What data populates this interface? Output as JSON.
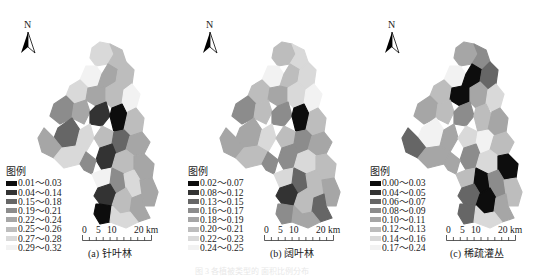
{
  "panels": [
    {
      "id": "a",
      "north_label": "N",
      "legend_title": "图例",
      "legend": [
        {
          "label": "0.01～0.03",
          "color": "#0d0d0d"
        },
        {
          "label": "0.04～0.14",
          "color": "#333333"
        },
        {
          "label": "0.15～0.18",
          "color": "#666666"
        },
        {
          "label": "0.19～0.21",
          "color": "#8c8c8c"
        },
        {
          "label": "0.22～0.24",
          "color": "#a6a6a6"
        },
        {
          "label": "0.25～0.26",
          "color": "#bdbdbd"
        },
        {
          "label": "0.27～0.28",
          "color": "#d9d9d9"
        },
        {
          "label": "0.29～0.32",
          "color": "#f2f2f2"
        }
      ],
      "scale_labels": [
        "0",
        "5",
        "10",
        "20 km"
      ],
      "caption": "(a) 针叶林",
      "region_classes": [
        6,
        5,
        7,
        4,
        5,
        6,
        0,
        4,
        5,
        7,
        3,
        4,
        2,
        1,
        0,
        5,
        4,
        6,
        5,
        2,
        4,
        6,
        1,
        3,
        5,
        4,
        7,
        3,
        1,
        6,
        4,
        5,
        0,
        4,
        6
      ]
    },
    {
      "id": "b",
      "north_label": "N",
      "legend_title": "图例",
      "legend": [
        {
          "label": "0.02～0.07",
          "color": "#0d0d0d"
        },
        {
          "label": "0.08～0.12",
          "color": "#333333"
        },
        {
          "label": "0.13～0.15",
          "color": "#666666"
        },
        {
          "label": "0.16～0.17",
          "color": "#8c8c8c"
        },
        {
          "label": "0.18～0.19",
          "color": "#a6a6a6"
        },
        {
          "label": "0.20～0.21",
          "color": "#bdbdbd"
        },
        {
          "label": "0.22～0.23",
          "color": "#d9d9d9"
        },
        {
          "label": "0.24～0.25",
          "color": "#f2f2f2"
        }
      ],
      "scale_labels": [
        "0",
        "5",
        "10",
        "20 km"
      ],
      "caption": "(b) 阔叶林",
      "region_classes": [
        5,
        6,
        7,
        5,
        6,
        5,
        0,
        4,
        6,
        7,
        3,
        5,
        4,
        3,
        0,
        5,
        4,
        6,
        5,
        3,
        4,
        5,
        3,
        3,
        6,
        5,
        6,
        2,
        1,
        5,
        4,
        5,
        3,
        2,
        4
      ]
    },
    {
      "id": "c",
      "north_label": "N",
      "legend_title": "图例",
      "legend": [
        {
          "label": "0.00～0.03",
          "color": "#0d0d0d"
        },
        {
          "label": "0.04～0.05",
          "color": "#333333"
        },
        {
          "label": "0.06～0.07",
          "color": "#666666"
        },
        {
          "label": "0.08～0.09",
          "color": "#8c8c8c"
        },
        {
          "label": "0.10～0.11",
          "color": "#a6a6a6"
        },
        {
          "label": "0.12～0.13",
          "color": "#bdbdbd"
        },
        {
          "label": "0.14～0.16",
          "color": "#d9d9d9"
        },
        {
          "label": "0.17～0.24",
          "color": "#f2f2f2"
        }
      ],
      "scale_labels": [
        "0",
        "5",
        "10",
        "20 km"
      ],
      "caption": "(c) 稀疏灌丛",
      "region_classes": [
        4,
        3,
        7,
        0,
        2,
        5,
        1,
        0,
        4,
        6,
        4,
        5,
        7,
        3,
        5,
        4,
        2,
        4,
        6,
        7,
        5,
        4,
        3,
        4,
        6,
        0,
        5,
        0,
        2,
        3,
        5,
        0,
        2,
        4,
        6
      ]
    }
  ],
  "bottom_caption": "图  3  各植被类型的  面积比例分布"
}
